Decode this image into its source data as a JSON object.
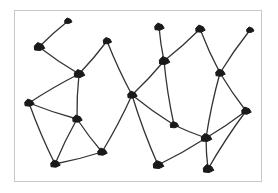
{
  "diagram": {
    "type": "graph",
    "colors": {
      "node": "#1a1a1a",
      "edge": "#333333",
      "frame": "#c8c8c8",
      "background": "#ffffff"
    },
    "frame": {
      "x": 14,
      "y": 10,
      "width": 248,
      "height": 172
    },
    "nodes": [
      {
        "id": "A",
        "x": 68,
        "y": 21,
        "r": 3.5
      },
      {
        "id": "B",
        "x": 39,
        "y": 47,
        "r": 5
      },
      {
        "id": "C",
        "x": 107,
        "y": 41,
        "r": 4
      },
      {
        "id": "D",
        "x": 79,
        "y": 74,
        "r": 5
      },
      {
        "id": "E",
        "x": 29,
        "y": 103,
        "r": 4.5
      },
      {
        "id": "F",
        "x": 77,
        "y": 119,
        "r": 4.5
      },
      {
        "id": "G",
        "x": 55,
        "y": 164,
        "r": 4.5
      },
      {
        "id": "H",
        "x": 102,
        "y": 152,
        "r": 4.5
      },
      {
        "id": "I",
        "x": 132,
        "y": 95,
        "r": 4.5
      },
      {
        "id": "J",
        "x": 159,
        "y": 27,
        "r": 4.5
      },
      {
        "id": "K",
        "x": 164,
        "y": 61,
        "r": 5
      },
      {
        "id": "L",
        "x": 200,
        "y": 29,
        "r": 4.5
      },
      {
        "id": "M",
        "x": 220,
        "y": 73,
        "r": 4.5
      },
      {
        "id": "N",
        "x": 250,
        "y": 30,
        "r": 3.5
      },
      {
        "id": "O",
        "x": 174,
        "y": 125,
        "r": 4
      },
      {
        "id": "P",
        "x": 206,
        "y": 138,
        "r": 5
      },
      {
        "id": "Q",
        "x": 246,
        "y": 111,
        "r": 4.5
      },
      {
        "id": "R",
        "x": 158,
        "y": 165,
        "r": 5
      },
      {
        "id": "S",
        "x": 208,
        "y": 169,
        "r": 5
      }
    ],
    "edges": [
      [
        "A",
        "B"
      ],
      [
        "B",
        "D"
      ],
      [
        "D",
        "C"
      ],
      [
        "C",
        "I"
      ],
      [
        "D",
        "E"
      ],
      [
        "D",
        "F"
      ],
      [
        "E",
        "F"
      ],
      [
        "E",
        "G"
      ],
      [
        "F",
        "G"
      ],
      [
        "F",
        "H"
      ],
      [
        "G",
        "H"
      ],
      [
        "H",
        "I"
      ],
      [
        "I",
        "K"
      ],
      [
        "I",
        "O"
      ],
      [
        "I",
        "R"
      ],
      [
        "J",
        "K"
      ],
      [
        "K",
        "L"
      ],
      [
        "K",
        "O"
      ],
      [
        "L",
        "M"
      ],
      [
        "N",
        "M"
      ],
      [
        "M",
        "P"
      ],
      [
        "M",
        "Q"
      ],
      [
        "O",
        "P"
      ],
      [
        "P",
        "Q"
      ],
      [
        "P",
        "S"
      ],
      [
        "Q",
        "S"
      ],
      [
        "R",
        "P"
      ]
    ]
  }
}
